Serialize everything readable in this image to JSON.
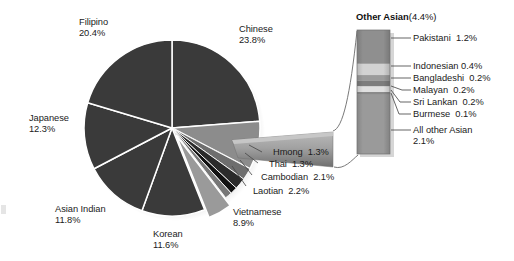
{
  "chart_data": {
    "type": "pie",
    "title": "",
    "subtitle": "",
    "xlabel": "",
    "ylabel": "",
    "legend_position": "none",
    "grid": false,
    "unit": "percent",
    "categories": [
      "Chinese",
      "Vietnamese",
      "Laotian",
      "Cambodian",
      "Thai",
      "Hmong",
      "Other Asian",
      "Korean",
      "Asian Indian",
      "Japanese",
      "Filipino"
    ],
    "values": [
      23.8,
      8.9,
      2.2,
      2.1,
      1.3,
      1.3,
      4.4,
      11.6,
      11.8,
      12.3,
      20.4
    ],
    "slices": [
      {
        "label": "Chinese",
        "value": 23.8,
        "display": "23.8%",
        "color": "#3a3a3a",
        "exploded": false
      },
      {
        "label": "Vietnamese",
        "value": 8.9,
        "display": "8.9%",
        "color": "#8c8c8c",
        "exploded": false
      },
      {
        "label": "Laotian",
        "value": 2.2,
        "display": "2.2%",
        "color": "#6e6e6e",
        "exploded": false
      },
      {
        "label": "Cambodian",
        "value": 2.1,
        "display": "2.1%",
        "color": "#2b2b2b",
        "exploded": false
      },
      {
        "label": "Thai",
        "value": 1.3,
        "display": "1.3%",
        "color": "#111111",
        "exploded": false
      },
      {
        "label": "Hmong",
        "value": 1.3,
        "display": "1.3%",
        "color": "#777777",
        "exploded": false
      },
      {
        "label": "Other Asian",
        "value": 4.4,
        "display": "4.4%",
        "color": "#9a9a9a",
        "exploded": true
      },
      {
        "label": "Korean",
        "value": 11.6,
        "display": "11.6%",
        "color": "#3a3a3a",
        "exploded": false
      },
      {
        "label": "Asian Indian",
        "value": 11.8,
        "display": "11.8%",
        "color": "#3a3a3a",
        "exploded": false
      },
      {
        "label": "Japanese",
        "value": 12.3,
        "display": "12.3%",
        "color": "#3a3a3a",
        "exploded": false
      },
      {
        "label": "Filipino",
        "value": 20.4,
        "display": "20.4%",
        "color": "#3a3a3a",
        "exploded": false
      }
    ],
    "callout": {
      "type": "stacked_bar_breakout",
      "title_bold": "Other Asian",
      "title_pct": "(4.4%)",
      "total": 4.4,
      "segments": [
        {
          "label": "Pakistani",
          "value": 1.2,
          "display": "1.2%",
          "color": "#8f8f8f"
        },
        {
          "label": "Indonesian",
          "value": 0.4,
          "display": "0.4%",
          "color": "#d2d2d2"
        },
        {
          "label": "Bangladeshi",
          "value": 0.2,
          "display": "0.2%",
          "color": "#9b9b9b"
        },
        {
          "label": "Malayan",
          "value": 0.2,
          "display": "0.2%",
          "color": "#7d7d7d"
        },
        {
          "label": "Sri Lankan",
          "value": 0.2,
          "display": "0.2%",
          "color": "#e0e0e0"
        },
        {
          "label": "Burmese",
          "value": 0.1,
          "display": "0.1%",
          "color": "#8a8a8a"
        },
        {
          "label": "All other Asian",
          "value": 2.1,
          "display": "2.1%",
          "color": "#9a9a9a"
        }
      ]
    }
  },
  "pie_labels": {
    "filipino": {
      "name": "Filipino",
      "pct": "20.4%"
    },
    "chinese": {
      "name": "Chinese",
      "pct": "23.8%"
    },
    "japanese": {
      "name": "Japanese",
      "pct": "12.3%"
    },
    "asian_indian": {
      "name": "Asian Indian",
      "pct": "11.8%"
    },
    "korean": {
      "name": "Korean",
      "pct": "11.6%"
    },
    "vietnamese": {
      "name": "Vietnamese",
      "pct": "8.9%"
    },
    "laotian": "Laotian  2.2%",
    "cambodian": "Cambodian  2.1%",
    "thai": "Thai  1.3%",
    "hmong": "Hmong  1.3%"
  },
  "callout_title": {
    "bold": "Other Asian",
    "pct": "(4.4%)"
  },
  "callout_legend": {
    "pakistani": "Pakistani  1.2%",
    "indonesian": "Indonesian 0.4%",
    "bangladeshi": "Bangladeshi  0.2%",
    "malayan": "Malayan  0.2%",
    "sri_lankan": "Sri Lankan  0.2%",
    "burmese": "Burmese  0.1%",
    "all_other_1": "All other Asian",
    "all_other_2": "2.1%"
  },
  "colors": {
    "slice_dark": "#3a3a3a",
    "slice_mid": "#8c8c8c",
    "slice_black": "#111111",
    "background": "#ffffff",
    "text": "#1a1a1a",
    "separator": "#ffffff",
    "leader": "#4a4a4a"
  }
}
